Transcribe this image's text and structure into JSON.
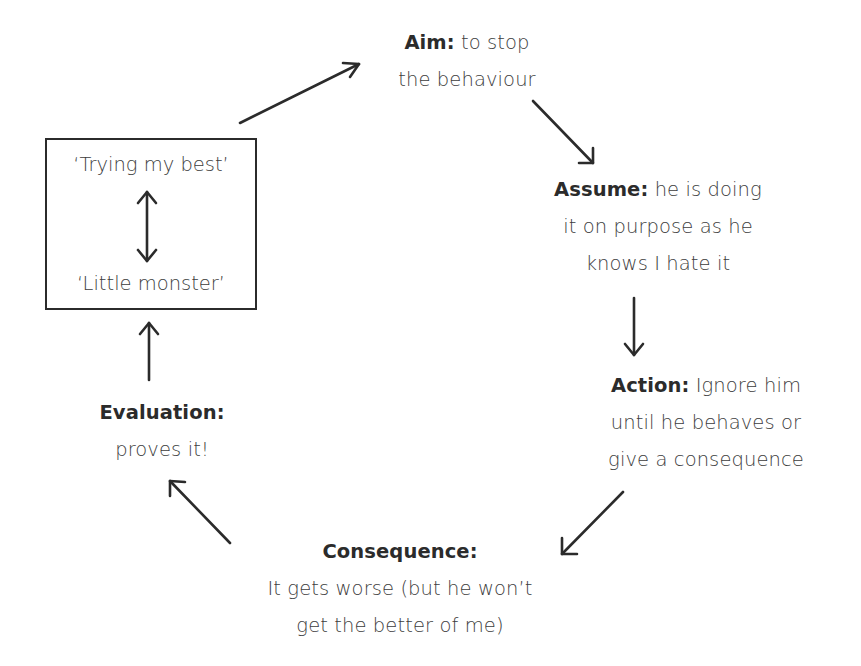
{
  "diagram": {
    "type": "cycle",
    "colors": {
      "text": "#3d3d3d",
      "bold_text": "#2b2b2b",
      "stroke": "#2b2b2b",
      "background": "#ffffff"
    },
    "box": {
      "top_label": "‘Trying my best’",
      "bottom_label": "‘Little monster’",
      "inner_arrow": "double-headed-vertical-arrow"
    },
    "nodes": {
      "aim": {
        "title": "Aim:",
        "lines": [
          "to stop",
          "the behaviour"
        ]
      },
      "assume": {
        "title": "Assume:",
        "lines": [
          "he is doing",
          "it on purpose as he",
          "knows I hate it"
        ]
      },
      "action": {
        "title": "Action:",
        "lines": [
          "Ignore him",
          "until he behaves or",
          "give a consequence"
        ]
      },
      "consequence": {
        "title": "Consequence:",
        "lines": [
          "It gets worse (but he won’t",
          "get the better of me)"
        ]
      },
      "evaluation": {
        "title": "Evaluation:",
        "lines": [
          "proves it!"
        ]
      }
    },
    "flow": [
      "box -> aim",
      "aim -> assume",
      "assume -> action",
      "action -> consequence",
      "consequence -> evaluation",
      "evaluation -> box"
    ]
  }
}
